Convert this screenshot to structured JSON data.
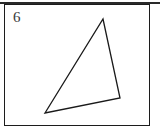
{
  "figure": {
    "label": "6",
    "label_position": {
      "x": 13,
      "y": 9
    },
    "background_color": "#ffffff",
    "frame": {
      "name": "figure-border",
      "x": 4,
      "y": 4,
      "width": 146,
      "height": 122,
      "stroke_color": "#1c1c1c",
      "stroke_width": 1,
      "fill": "none"
    },
    "top_rule": {
      "name": "page-top-rule",
      "x": 0,
      "y": 2,
      "width": 160,
      "height": 2,
      "color": "#2a2a2a"
    }
  },
  "shape": {
    "name": "triangle",
    "type": "polygon",
    "sides": 3,
    "fill": "none",
    "stroke_color": "#1a1a1a",
    "stroke_width": 1.3,
    "points_attr": "103,19 120,98 45,113",
    "vertices": [
      {
        "name": "apex-vertex",
        "x": 103,
        "y": 19
      },
      {
        "name": "right-vertex",
        "x": 120,
        "y": 98
      },
      {
        "name": "bottom-left-vertex",
        "x": 45,
        "y": 113
      }
    ],
    "edges": [
      {
        "name": "left-edge",
        "from": "apex-vertex",
        "to": "bottom-left-vertex"
      },
      {
        "name": "right-edge",
        "from": "apex-vertex",
        "to": "right-vertex"
      },
      {
        "name": "bottom-edge",
        "from": "bottom-left-vertex",
        "to": "right-vertex"
      }
    ]
  }
}
